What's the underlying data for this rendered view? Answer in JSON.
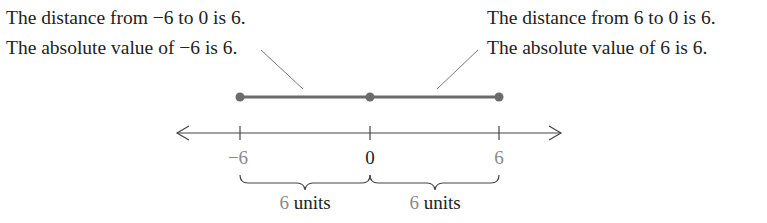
{
  "left_note": {
    "line1": "The distance from −6 to 0 is 6.",
    "line2": "The absolute value of −6 is 6."
  },
  "right_note": {
    "line1": "The distance from 6 to 0 is 6.",
    "line2": "The absolute value of 6 is 6."
  },
  "number_line": {
    "ticks": [
      {
        "label": "−6",
        "value": -6
      },
      {
        "label": "0",
        "value": 0
      },
      {
        "label": "6",
        "value": 6
      }
    ],
    "brace_left": {
      "number": "6",
      "unit": " units"
    },
    "brace_right": {
      "number": "6",
      "unit": " units"
    }
  },
  "colors": {
    "text": "#222222",
    "segment": "#6b6b6b",
    "dot": "#6b6b6b",
    "tick_label_gray": "#8a8a8a",
    "axis": "#444444"
  }
}
